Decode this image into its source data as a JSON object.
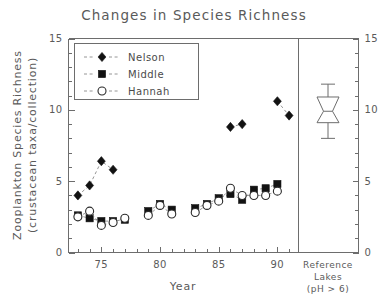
{
  "chart_data": {
    "type": "scatter",
    "title": "Changes in Species Richness",
    "xlabel": "Year",
    "ylabel": "Zooplankton Species Richness",
    "ylabel2": "(crustacean taxa/collection)",
    "xlim": [
      72.2,
      91.8
    ],
    "ylim": [
      0,
      15
    ],
    "xticks": [
      75,
      80,
      85,
      90
    ],
    "xticklabels": [
      "75",
      "80",
      "85",
      "90"
    ],
    "yticks": [
      0,
      5,
      10,
      15
    ],
    "yticklabels": [
      "0",
      "5",
      "10",
      "15"
    ],
    "y_minor_step": 1,
    "x_minor_step": 1,
    "grid": false,
    "legend_position": "top-left",
    "right_axis_mirrors_left": true,
    "series": [
      {
        "name": "Nelson",
        "marker": "filled-diamond",
        "connected": true,
        "x": [
          73,
          74,
          75,
          76,
          86,
          87,
          90,
          91
        ],
        "y": [
          4.0,
          4.7,
          6.4,
          5.8,
          8.8,
          9.0,
          10.6,
          9.6
        ]
      },
      {
        "name": "Middle",
        "marker": "filled-square",
        "connected": true,
        "x": [
          73,
          74,
          75,
          76,
          77,
          79,
          80,
          81,
          83,
          84,
          85,
          86,
          87,
          88,
          89,
          90
        ],
        "y": [
          2.6,
          2.4,
          2.2,
          2.2,
          2.3,
          2.9,
          3.4,
          3.0,
          3.1,
          3.4,
          3.8,
          4.1,
          3.7,
          4.4,
          4.5,
          4.8
        ]
      },
      {
        "name": "Hannah",
        "marker": "open-circle",
        "connected": true,
        "x": [
          73,
          74,
          75,
          76,
          77,
          79,
          80,
          81,
          83,
          84,
          85,
          86,
          87,
          88,
          89,
          90
        ],
        "y": [
          2.5,
          2.9,
          1.9,
          2.1,
          2.4,
          2.6,
          3.3,
          2.7,
          2.8,
          3.3,
          3.6,
          4.5,
          4.0,
          4.0,
          4.0,
          4.3
        ]
      }
    ],
    "side_panel": {
      "type": "boxplot",
      "label_line1": "Reference",
      "label_line2": "Lakes",
      "label_line3": "(pH > 6)",
      "whisker_low": 8.0,
      "q1": 9.1,
      "notch_low": 9.5,
      "median": 9.9,
      "notch_high": 10.3,
      "q3": 10.9,
      "whisker_high": 11.8
    },
    "colors": {
      "marker_fill": "#121212",
      "marker_open_fill": "#ffffff",
      "line": "#8a8a8a",
      "axis": "#6d6d6d",
      "text": "#5a5a5a",
      "background": "#ffffff"
    }
  },
  "legend": {
    "entries": [
      {
        "label": "Nelson",
        "marker": "filled-diamond"
      },
      {
        "label": "Middle",
        "marker": "filled-square"
      },
      {
        "label": "Hannah",
        "marker": "open-circle"
      }
    ]
  }
}
